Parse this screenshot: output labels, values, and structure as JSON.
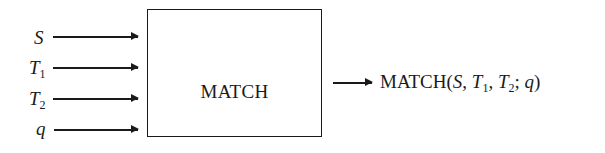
{
  "diagram": {
    "inputs": [
      {
        "symbol": "S",
        "subscript": ""
      },
      {
        "symbol": "T",
        "subscript": "1"
      },
      {
        "symbol": "T",
        "subscript": "2"
      },
      {
        "symbol": "q",
        "subscript": ""
      }
    ],
    "box": {
      "label": "MATCH"
    },
    "output": {
      "function_name": "MATCH",
      "open_paren": "(",
      "args": [
        {
          "symbol": "S",
          "subscript": "",
          "sep": ", "
        },
        {
          "symbol": "T",
          "subscript": "1",
          "sep": ", "
        },
        {
          "symbol": "T",
          "subscript": "2",
          "sep": "; "
        },
        {
          "symbol": "q",
          "subscript": "",
          "sep": ""
        }
      ],
      "close_paren": ")"
    }
  }
}
